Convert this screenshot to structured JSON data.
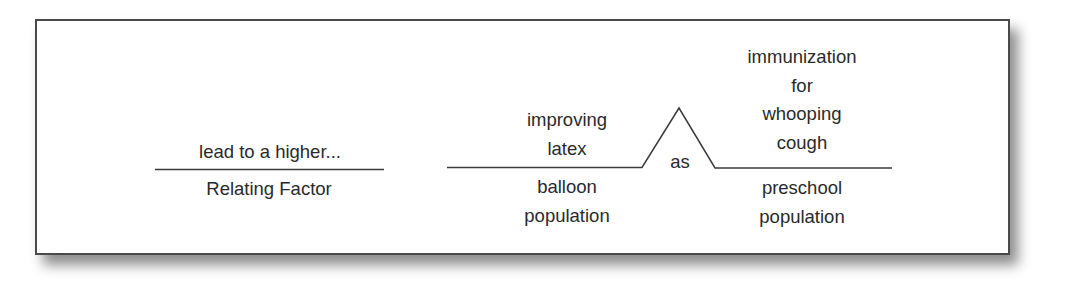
{
  "diagram": {
    "type": "sentence-diagram-analogy",
    "relating_factor": {
      "above": "lead to a higher...",
      "below": "Relating Factor"
    },
    "left_pair": {
      "above": [
        "improving",
        "latex"
      ],
      "below": [
        "balloon",
        "population"
      ]
    },
    "connector": {
      "label": "as"
    },
    "right_pair": {
      "above": [
        "immunization",
        "for",
        "whooping",
        "cough"
      ],
      "below": [
        "preschool",
        "population"
      ]
    },
    "colors": {
      "line": "#3a3a3a",
      "text": "#2a2a2a",
      "frame_border": "#4a4a4a",
      "background": "#ffffff"
    }
  }
}
